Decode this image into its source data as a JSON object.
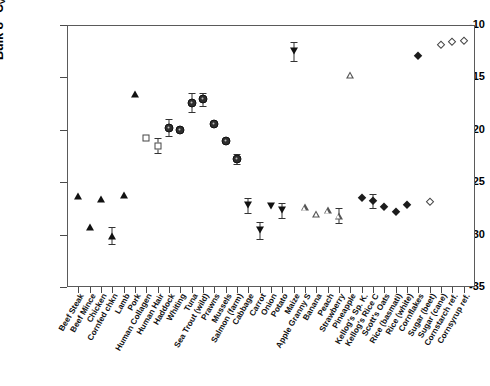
{
  "chart_data": {
    "type": "scatter",
    "title": "",
    "xlabel": "",
    "ylabel": "Bulk δ13C VPDB [‰] ± 2σ",
    "ylim": [
      -35,
      -10
    ],
    "yticks": [
      -10,
      -15,
      -20,
      -25,
      -30,
      -35
    ],
    "ytick_labels": [
      "-10",
      "-15",
      "-20",
      "-25",
      "-30",
      "-35"
    ],
    "grid": false,
    "legend": "none",
    "categories": [
      "Beef Steak",
      "Beef Mince",
      "Chicken",
      "Cornfed chkn",
      "Lamb",
      "Pork",
      "Human Collagen",
      "Human Hair",
      "Haddock",
      "Whiting",
      "Tuna",
      "Sea Trout (wild)",
      "Prawns",
      "Mussels",
      "Salmon (farm)",
      "Cabbage",
      "Carrot",
      "Onion",
      "Potato",
      "Maize",
      "Apple Granny S",
      "Banana",
      "Peach",
      "Strawberry",
      "Pineapple",
      "Kellog's Sp. K.",
      "Kellog's Rice C",
      "Scott's Oats",
      "Rice (basmati)",
      "Rice (white)",
      "Cornflakes",
      "Sugar (beet)",
      "Sugar (cane)",
      "Cornstarch ref.",
      "Cornsyrup ref."
    ],
    "values": [
      -26.3,
      -29.3,
      -26.6,
      -30.1,
      -26.2,
      -16.6,
      -20.8,
      -21.5,
      -19.8,
      -20.0,
      -17.4,
      -17.1,
      -19.4,
      -21.1,
      -22.8,
      -27.2,
      -29.6,
      -27.3,
      -27.7,
      -12.5,
      -27.4,
      -28.0,
      -27.7,
      -28.2,
      -14.8,
      -26.5,
      -26.8,
      -27.4,
      -27.8,
      -27.2,
      -13.0,
      -26.9,
      -11.9,
      -11.6,
      -11.5
    ],
    "errors": [
      0,
      0,
      0,
      0.8,
      0,
      0,
      0,
      0.7,
      0.8,
      0,
      0.9,
      0.6,
      0,
      0,
      0.5,
      0.7,
      0.8,
      0,
      0.7,
      0.9,
      0,
      0,
      0,
      0.7,
      0,
      0,
      0.7,
      0,
      0,
      0,
      0,
      0,
      0,
      0,
      0
    ],
    "marker_types": [
      "tri-up",
      "tri-up",
      "tri-up",
      "tri-up",
      "tri-up",
      "tri-up",
      "square-open",
      "square-open",
      "circle",
      "circle",
      "circle",
      "circle",
      "circle",
      "circle",
      "circle",
      "tri-down",
      "tri-down",
      "tri-down",
      "tri-down",
      "tri-down",
      "tri-up-open",
      "tri-up-open",
      "tri-up-open",
      "tri-up-open",
      "tri-up-open",
      "diamond",
      "diamond",
      "diamond",
      "diamond",
      "diamond",
      "diamond",
      "diamond-open",
      "diamond-open",
      "diamond-open",
      "diamond-open"
    ],
    "series_groups": [
      {
        "name": "Animal protein (meat)",
        "marker": "tri-up",
        "color": "#111111"
      },
      {
        "name": "Human tissue",
        "marker": "square-open",
        "color": "#444444"
      },
      {
        "name": "Fish and seafood",
        "marker": "circle",
        "color": "#2e2e2e"
      },
      {
        "name": "Vegetables",
        "marker": "tri-down",
        "color": "#111111"
      },
      {
        "name": "Fruits",
        "marker": "tri-up-open",
        "color": "#555555"
      },
      {
        "name": "Cereals and starches",
        "marker": "diamond",
        "color": "#1c1c1c"
      },
      {
        "name": "Sugars and references",
        "marker": "diamond-open",
        "color": "#444444"
      }
    ]
  }
}
